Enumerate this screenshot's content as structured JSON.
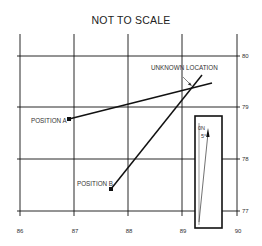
{
  "title": "NOT TO SCALE",
  "x_axis": {
    "ticks": [
      "86",
      "87",
      "88",
      "89",
      "90"
    ]
  },
  "y_axis": {
    "ticks": [
      "80",
      "79",
      "78",
      "77"
    ]
  },
  "labels": {
    "unknown_location": "UNKNOWN LOCATION",
    "position_a": "POSITION A",
    "position_b": "POSITION B"
  },
  "inset": {
    "north_label": "0N",
    "angle_label": "5°"
  },
  "colors": {
    "line": "#111111",
    "text": "#333333",
    "background": "#ffffff"
  }
}
